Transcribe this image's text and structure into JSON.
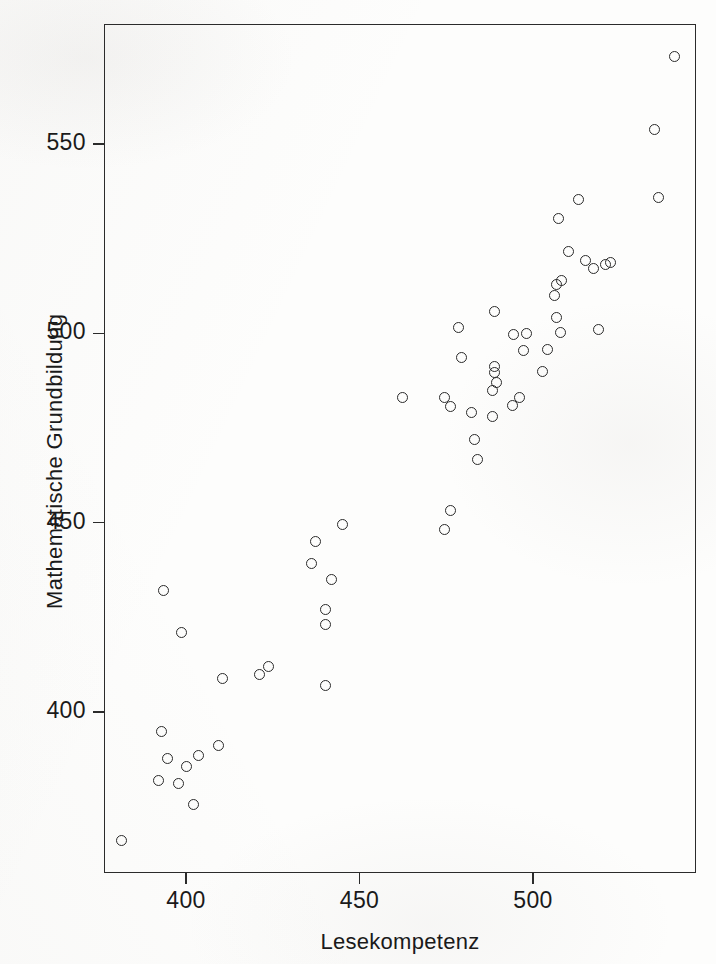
{
  "chart_data": {
    "type": "scatter",
    "title": "",
    "xlabel": "Lesekompetenz",
    "ylabel": "Mathematische Grundbildung",
    "xlim": [
      379,
      545
    ],
    "ylim": [
      357,
      578
    ],
    "xticks": [
      400,
      450,
      500
    ],
    "xtick_labels": [
      "400",
      "450",
      "500"
    ],
    "yticks": [
      400,
      450,
      500,
      550
    ],
    "ytick_labels": [
      "400",
      "450",
      "500",
      "550"
    ],
    "grid": false,
    "legend": null,
    "marker": "open-circle",
    "marker_color": "#2a2a2a",
    "n_points": 60,
    "points": [
      {
        "x": 381.5,
        "y": 366.0
      },
      {
        "x": 392.0,
        "y": 382.0
      },
      {
        "x": 397.8,
        "y": 381.2
      },
      {
        "x": 392.9,
        "y": 394.9
      },
      {
        "x": 394.6,
        "y": 387.8
      },
      {
        "x": 400.0,
        "y": 385.7
      },
      {
        "x": 402.3,
        "y": 375.5
      },
      {
        "x": 403.5,
        "y": 388.4
      },
      {
        "x": 409.5,
        "y": 391.1
      },
      {
        "x": 393.5,
        "y": 432.0
      },
      {
        "x": 398.7,
        "y": 420.9
      },
      {
        "x": 410.6,
        "y": 408.8
      },
      {
        "x": 421.3,
        "y": 410.0
      },
      {
        "x": 423.9,
        "y": 412.0
      },
      {
        "x": 440.1,
        "y": 406.9
      },
      {
        "x": 440.1,
        "y": 423.0
      },
      {
        "x": 440.1,
        "y": 427.0
      },
      {
        "x": 441.8,
        "y": 434.9
      },
      {
        "x": 436.2,
        "y": 439.2
      },
      {
        "x": 437.4,
        "y": 444.9
      },
      {
        "x": 445.0,
        "y": 449.4
      },
      {
        "x": 474.6,
        "y": 448.2
      },
      {
        "x": 476.3,
        "y": 453.3
      },
      {
        "x": 462.5,
        "y": 483.1
      },
      {
        "x": 474.6,
        "y": 483.1
      },
      {
        "x": 476.3,
        "y": 480.7
      },
      {
        "x": 482.4,
        "y": 479.0
      },
      {
        "x": 484.1,
        "y": 466.6
      },
      {
        "x": 483.0,
        "y": 472.0
      },
      {
        "x": 488.3,
        "y": 478.0
      },
      {
        "x": 488.3,
        "y": 485.0
      },
      {
        "x": 489.5,
        "y": 486.9
      },
      {
        "x": 489.0,
        "y": 489.7
      },
      {
        "x": 488.9,
        "y": 491.1
      },
      {
        "x": 479.5,
        "y": 493.5
      },
      {
        "x": 478.4,
        "y": 501.4
      },
      {
        "x": 489.0,
        "y": 505.8
      },
      {
        "x": 494.5,
        "y": 499.8
      },
      {
        "x": 498.0,
        "y": 500.0
      },
      {
        "x": 497.4,
        "y": 495.4
      },
      {
        "x": 496.2,
        "y": 483.1
      },
      {
        "x": 502.6,
        "y": 490.0
      },
      {
        "x": 504.3,
        "y": 495.6
      },
      {
        "x": 506.9,
        "y": 504.2
      },
      {
        "x": 508.0,
        "y": 500.1
      },
      {
        "x": 519.0,
        "y": 501.0
      },
      {
        "x": 506.3,
        "y": 510.0
      },
      {
        "x": 506.9,
        "y": 512.9
      },
      {
        "x": 508.2,
        "y": 513.9
      },
      {
        "x": 510.1,
        "y": 521.7
      },
      {
        "x": 507.3,
        "y": 530.2
      },
      {
        "x": 513.2,
        "y": 535.4
      },
      {
        "x": 515.0,
        "y": 519.3
      },
      {
        "x": 517.5,
        "y": 517.2
      },
      {
        "x": 521.0,
        "y": 518.3
      },
      {
        "x": 522.2,
        "y": 518.6
      },
      {
        "x": 536.1,
        "y": 536.0
      },
      {
        "x": 535.1,
        "y": 553.8
      },
      {
        "x": 540.8,
        "y": 573.0
      },
      {
        "x": 494.1,
        "y": 481.0
      }
    ]
  },
  "plot": {
    "frame": {
      "left": 104,
      "top": 24,
      "width": 592,
      "height": 849
    },
    "x_axis": {
      "pixel_at_400": 186,
      "px_per_unit": 3.47
    },
    "y_axis": {
      "pixel_at_550": 144,
      "px_per_unit": 3.786
    }
  }
}
